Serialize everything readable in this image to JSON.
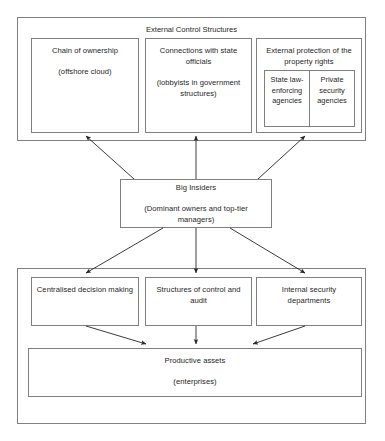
{
  "diagram": {
    "title": "External Control Structures",
    "groups": {
      "external": {
        "label": "External Control Structures",
        "boxes": [
          {
            "id": "chain-of-ownership",
            "line1": "Chain of ownership",
            "line2": "(offshore cloud)"
          },
          {
            "id": "connections-with-state-officials",
            "line1": "Connections with state officials",
            "line2": "(lobbyists in government structures)"
          },
          {
            "id": "external-protection-of-property-rights",
            "line1": "External protection of the property rights",
            "sub": [
              {
                "id": "state-law-enforcing-agencies",
                "label": "State law-enforcing agencies"
              },
              {
                "id": "private-security-agencies",
                "label": "Private security agencies"
              }
            ]
          }
        ]
      },
      "insiders": {
        "id": "big-insiders",
        "line1": "Big Insiders",
        "line2": "(Dominant owners and top-tier managers)"
      },
      "internal": {
        "boxes": [
          {
            "id": "centralised-decision-making",
            "label": "Centralised decision making"
          },
          {
            "id": "structures-of-control-and-audit",
            "label": "Structures of control and audit"
          },
          {
            "id": "internal-security-departments",
            "label": "Internal security departments"
          }
        ],
        "assets": {
          "id": "productive-assets",
          "line1": "Productive assets",
          "line2": "(enterprises)"
        }
      }
    },
    "colors": {
      "stroke": "#7f7f7f",
      "arrow": "#262626",
      "text": "#262626",
      "background": "#ffffff"
    }
  }
}
